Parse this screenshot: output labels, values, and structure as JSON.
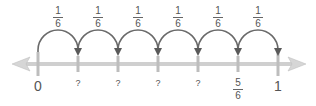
{
  "number_line": {
    "start_label": "0",
    "end_label": "1",
    "jump_label": {
      "numerator": "1",
      "denominator": "6"
    },
    "jumps": 6,
    "ticks": [
      {
        "label": "0",
        "type": "whole"
      },
      {
        "label": "?",
        "type": "unknown"
      },
      {
        "label": "?",
        "type": "unknown"
      },
      {
        "label": "?",
        "type": "unknown"
      },
      {
        "label": "?",
        "type": "unknown"
      },
      {
        "label": "5/6",
        "type": "fraction",
        "numerator": "5",
        "denominator": "6"
      },
      {
        "label": "1",
        "type": "whole"
      }
    ],
    "colors": {
      "axis": "#c8c8c8",
      "tick": "#b0b0b0",
      "arc": "#666666",
      "text": "#555555"
    }
  },
  "labels": {
    "zero": "0",
    "one": "1",
    "q1": "?",
    "q2": "?",
    "q3": "?",
    "q4": "?",
    "five_sixths_num": "5",
    "five_sixths_den": "6",
    "jump_num": "1",
    "jump_den": "6"
  }
}
